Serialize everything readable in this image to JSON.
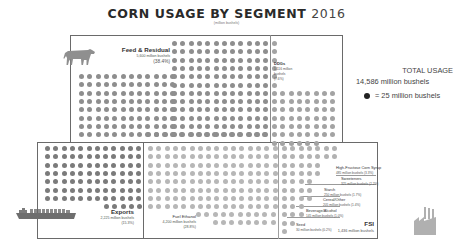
{
  "header": {
    "title": "CORN USAGE BY SEGMENT",
    "year": "2016",
    "subtitle": "(million bushels)"
  },
  "summary": {
    "total_label": "TOTAL USAGE",
    "total_value": "14,586 million bushels",
    "legend_text": "= 25 million bushels"
  },
  "segments": {
    "feed": {
      "label": "Feed & Residual",
      "value": "5,600 million bushels",
      "pct": "(38.4%)"
    },
    "ddgs": {
      "label": "DDGs",
      "value_line1": "1,116 million",
      "value_line2": "bushels",
      "pct": "(7.6%)"
    },
    "exports": {
      "label": "Exports",
      "value": "2,225 million bushels",
      "pct": "(15.3%)"
    },
    "ethanol": {
      "label": "Fuel Ethanol",
      "value": "4,200 million bushels",
      "pct": "(28.8%)"
    },
    "fsi": {
      "label": "FSI",
      "value": "1,436 million bushels"
    },
    "hfcs": {
      "label": "High-Fructose Corn Syrup",
      "value": "485 million bushels (3.3%)"
    },
    "sweeteners": {
      "label": "Sweeteners",
      "value": "325 million bushels (2.2%)"
    },
    "starch": {
      "label": "Starch",
      "value": "250 million bushels (1.7%)"
    },
    "cereal": {
      "label": "Cereal/Other",
      "value": "205 million bushels (1.4%)"
    },
    "beverage": {
      "label": "Beverage/Alcohol",
      "value": "145 million bushels (1.0%)"
    },
    "seed": {
      "label": "Seed",
      "value": "30 million bushels (0.2%)"
    }
  },
  "icons": {
    "feed": "cow-icon",
    "exports": "cargo-ship-icon",
    "fsi": "factory-icon",
    "legend": "filled-circle-icon"
  },
  "colors": {
    "feed_dots": "#8e8e8e",
    "ddgs_dots": "#a3a3a3",
    "exports_dots": "#7b7b7b",
    "ethanol_dots": "#b7b7b7",
    "fsi_dots": "#b2b2b2",
    "border": "#6a6a6a",
    "legend_dot": "#222222"
  },
  "chart_data": {
    "type": "table",
    "title": "CORN USAGE BY SEGMENT 2016",
    "subtitle": "(million bushels)",
    "unit_note": "1 dot = 25 million bushels",
    "total": {
      "label": "TOTAL USAGE",
      "value": 14586,
      "unit": "million bushels"
    },
    "categories": [
      "Feed & Residual",
      "Fuel Ethanol",
      "Exports",
      "DDGs",
      "FSI"
    ],
    "values": [
      5600,
      4200,
      2225,
      1116,
      1436
    ],
    "percent": [
      38.4,
      28.8,
      15.3,
      7.6,
      null
    ],
    "fsi_breakdown": {
      "categories": [
        "High-Fructose Corn Syrup",
        "Sweeteners",
        "Starch",
        "Cereal/Other",
        "Beverage/Alcohol",
        "Seed"
      ],
      "values": [
        485,
        325,
        250,
        205,
        145,
        30
      ],
      "percent": [
        3.3,
        2.2,
        1.7,
        1.4,
        1.0,
        0.2
      ]
    }
  }
}
